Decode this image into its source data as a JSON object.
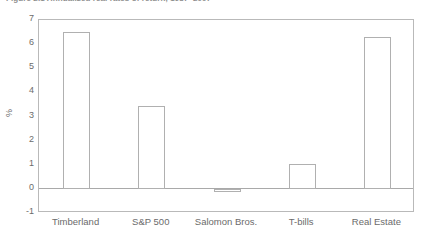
{
  "figure": {
    "caption": "Figure 2.1  Annualized real rates of return, 1987–2007"
  },
  "chart_data": {
    "type": "bar",
    "title": "",
    "subtitle": "",
    "xlabel": "",
    "ylabel": "%",
    "categories": [
      "Timberland",
      "S&P 500",
      "Salomon Bros.",
      "T-bills",
      "Real Estate"
    ],
    "values": [
      6.5,
      3.45,
      -0.15,
      1.05,
      6.3
    ],
    "series": [
      {
        "name": "Return",
        "values": [
          6.5,
          3.45,
          -0.15,
          1.05,
          6.3
        ]
      }
    ],
    "ylim": [
      -1,
      7
    ],
    "yticks": [
      7,
      6,
      5,
      4,
      3,
      2,
      1,
      0,
      -1
    ],
    "ytick_labels": [
      "7",
      "6",
      "5",
      "4",
      "3",
      "2",
      "1",
      "0",
      "-1"
    ],
    "grid": false,
    "legend": false,
    "legend_position": "none",
    "bar_fill_color": "#ffffff",
    "bar_edge_color": "#b0b0b0",
    "axis_color": "#b9b9b9",
    "text_color": "#6b6b6b"
  }
}
